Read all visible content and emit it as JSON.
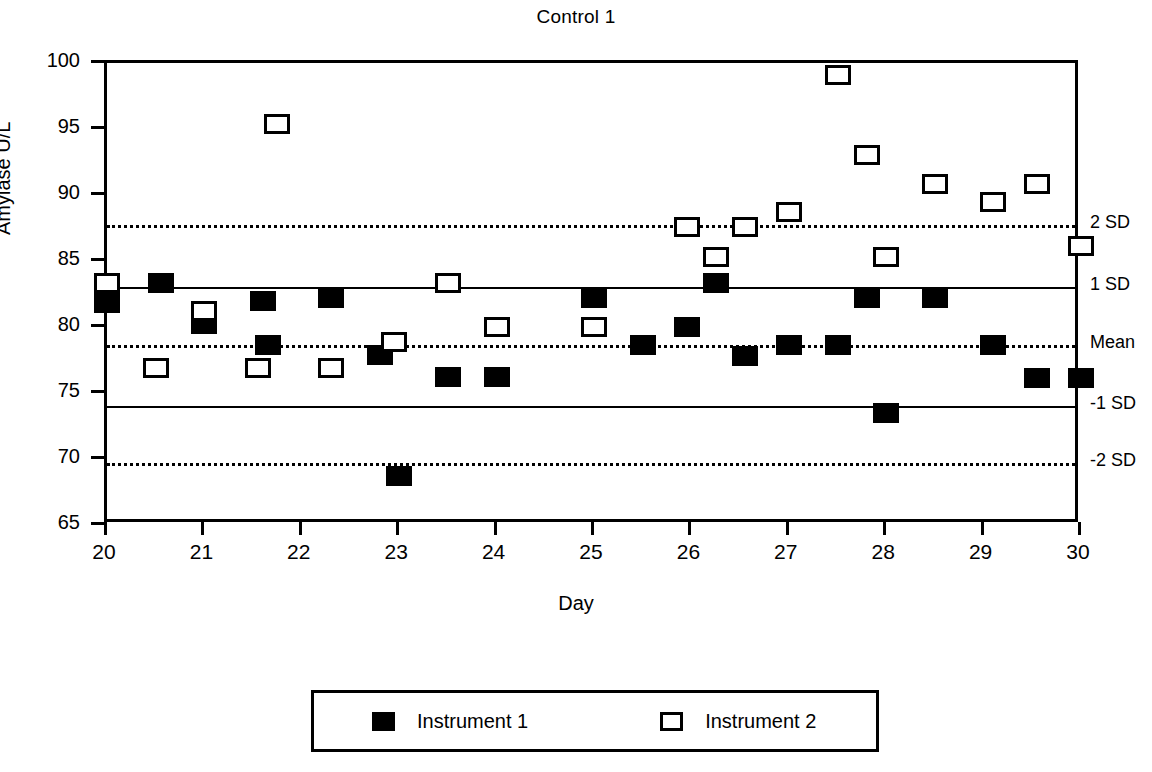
{
  "chart_data": {
    "type": "scatter",
    "title": "Control 1",
    "xlabel": "Day",
    "ylabel": "Amylase U/L",
    "xlim": [
      20,
      30
    ],
    "ylim": [
      65,
      100
    ],
    "xticks": [
      20,
      21,
      22,
      23,
      24,
      25,
      26,
      27,
      28,
      29,
      30
    ],
    "yticks": [
      65,
      70,
      75,
      80,
      85,
      90,
      95,
      100
    ],
    "grid": false,
    "legend_position": "bottom",
    "reference_lines": [
      {
        "label": "2 SD",
        "value": 87.7,
        "style": "dotted"
      },
      {
        "label": "1 SD",
        "value": 83.0,
        "style": "solid"
      },
      {
        "label": "Mean",
        "value": 78.6,
        "style": "dotted"
      },
      {
        "label": "-1 SD",
        "value": 74.0,
        "style": "solid"
      },
      {
        "label": "-2 SD",
        "value": 69.7,
        "style": "dotted"
      }
    ],
    "series": [
      {
        "name": "Instrument 1",
        "marker": "filled-square",
        "points": [
          {
            "x": 20.0,
            "y": 81.8
          },
          {
            "x": 20.55,
            "y": 83.3
          },
          {
            "x": 21.0,
            "y": 80.2
          },
          {
            "x": 21.6,
            "y": 82.0
          },
          {
            "x": 22.3,
            "y": 82.2
          },
          {
            "x": 21.65,
            "y": 78.6
          },
          {
            "x": 22.8,
            "y": 77.9
          },
          {
            "x": 23.0,
            "y": 68.7
          },
          {
            "x": 23.5,
            "y": 76.2
          },
          {
            "x": 24.0,
            "y": 76.2
          },
          {
            "x": 25.0,
            "y": 82.2
          },
          {
            "x": 25.5,
            "y": 78.6
          },
          {
            "x": 25.95,
            "y": 80.0
          },
          {
            "x": 26.25,
            "y": 83.3
          },
          {
            "x": 26.55,
            "y": 77.8
          },
          {
            "x": 27.0,
            "y": 78.6
          },
          {
            "x": 27.5,
            "y": 78.6
          },
          {
            "x": 27.8,
            "y": 82.2
          },
          {
            "x": 28.0,
            "y": 73.5
          },
          {
            "x": 28.5,
            "y": 82.2
          },
          {
            "x": 29.1,
            "y": 78.6
          },
          {
            "x": 29.55,
            "y": 76.1
          },
          {
            "x": 30.0,
            "y": 76.1
          }
        ]
      },
      {
        "name": "Instrument 2",
        "marker": "open-square",
        "points": [
          {
            "x": 20.0,
            "y": 83.3
          },
          {
            "x": 20.5,
            "y": 76.9
          },
          {
            "x": 21.0,
            "y": 81.2
          },
          {
            "x": 21.55,
            "y": 76.9
          },
          {
            "x": 21.75,
            "y": 95.4
          },
          {
            "x": 22.3,
            "y": 76.9
          },
          {
            "x": 22.95,
            "y": 78.9
          },
          {
            "x": 23.5,
            "y": 83.3
          },
          {
            "x": 24.0,
            "y": 80.0
          },
          {
            "x": 25.0,
            "y": 80.0
          },
          {
            "x": 25.95,
            "y": 87.6
          },
          {
            "x": 26.25,
            "y": 85.3
          },
          {
            "x": 26.55,
            "y": 87.6
          },
          {
            "x": 27.0,
            "y": 88.7
          },
          {
            "x": 27.5,
            "y": 99.1
          },
          {
            "x": 27.8,
            "y": 93.0
          },
          {
            "x": 28.0,
            "y": 85.3
          },
          {
            "x": 28.5,
            "y": 90.8
          },
          {
            "x": 29.1,
            "y": 89.5
          },
          {
            "x": 29.55,
            "y": 90.8
          },
          {
            "x": 30.0,
            "y": 86.1
          }
        ]
      }
    ]
  },
  "legend": {
    "entries": [
      {
        "label": "Instrument 1",
        "marker": "filled-square"
      },
      {
        "label": "Instrument 2",
        "marker": "open-square"
      }
    ]
  }
}
